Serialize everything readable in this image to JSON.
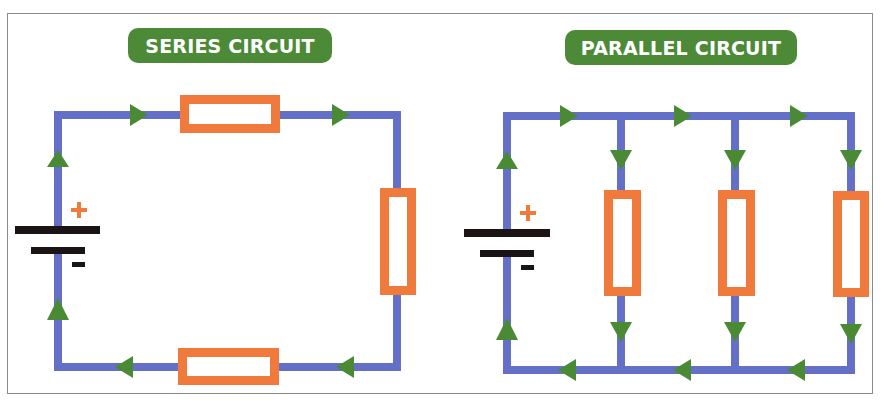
{
  "colors": {
    "wire": "#6470c8",
    "arrow": "#4a8a34",
    "resistor": "#f07a3c",
    "battery": "#1a1414",
    "plus": "#f07a3c",
    "title_bg": "#4d8a38",
    "title_text": "#ffffff"
  },
  "series": {
    "title": "SERIES CIRCUIT",
    "battery": {
      "plus_label": "+",
      "minus_label": "−"
    },
    "resistor_count": 3,
    "current_direction": "clockwise"
  },
  "parallel": {
    "title": "PARALLEL CIRCUIT",
    "battery": {
      "plus_label": "+",
      "minus_label": "−"
    },
    "resistor_count": 3,
    "branch_count": 3,
    "current_direction": "clockwise"
  }
}
